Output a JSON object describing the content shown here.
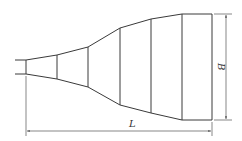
{
  "diagram": {
    "type": "technical drawing",
    "colors": {
      "stroke": "#3a3a3a",
      "dimension": "#555555",
      "background": "#ffffff"
    },
    "labels": {
      "length": "L",
      "width": "B"
    },
    "geometry": {
      "inlet_stub": {
        "x1": 15,
        "x2": 26,
        "y_top": 60,
        "y_bottom": 74
      },
      "sections_x": [
        26,
        57,
        88,
        120,
        151,
        182
      ],
      "top_profile_y": [
        60,
        55,
        47,
        28,
        19,
        14
      ],
      "bottom_profile_y": [
        74,
        79,
        87,
        105,
        113,
        120
      ],
      "outlet_rect": {
        "x1": 182,
        "x2": 212,
        "y_top": 14,
        "y_bottom": 120
      },
      "dim_L": {
        "x1": 26,
        "x2": 212,
        "y": 131
      },
      "dim_B": {
        "x": 226,
        "y1": 14,
        "y2": 120
      }
    }
  }
}
